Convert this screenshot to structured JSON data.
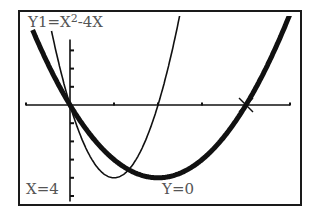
{
  "screen": {
    "function_label": {
      "prefix": "Y1=X",
      "exponent": "2",
      "suffix": "-4X"
    },
    "trace": {
      "x_readout": "X=4",
      "y_readout": "Y=0"
    },
    "cursor": {
      "x": 4,
      "y": 0,
      "marker": "x-cross"
    }
  },
  "chart_data": {
    "type": "line",
    "xlabel": "",
    "ylabel": "",
    "xlim": [
      -1,
      5.2
    ],
    "ylim": [
      -5.4,
      5.5
    ],
    "grid": false,
    "x_tick_step": 1,
    "y_tick_step": 1,
    "series": [
      {
        "name": "Y1=X²-4X",
        "expr": "x^2-4x",
        "style": "thick",
        "points": [
          [
            -0.8,
            3.84
          ],
          [
            0,
            0
          ],
          [
            1,
            -3
          ],
          [
            2,
            -4
          ],
          [
            3,
            -3
          ],
          [
            4,
            0
          ],
          [
            5,
            5
          ]
        ]
      },
      {
        "name": "4X²-8X",
        "expr": "4x^2-8x",
        "style": "thin",
        "points": [
          [
            -0.42,
            4.06
          ],
          [
            0,
            0
          ],
          [
            0.5,
            -3
          ],
          [
            1,
            -4
          ],
          [
            1.5,
            -3
          ],
          [
            2,
            0
          ],
          [
            2.5,
            5
          ]
        ]
      }
    ],
    "trace_point": {
      "x": 4,
      "y": 0
    }
  },
  "colors": {
    "frame": "#1a1a1a",
    "curve": "#111111",
    "text": "#555555",
    "background": "#ffffff"
  }
}
